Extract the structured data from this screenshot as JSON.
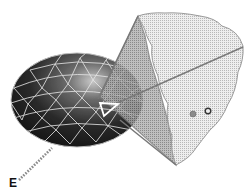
{
  "diagram": {
    "labels": {
      "eye_point": "E"
    },
    "colors": {
      "sphere_dark": "#1e1e1e",
      "sphere_mid": "#6a6a6a",
      "mesh_lines": "#e8e8e8",
      "patch_fill": "#d8d8d8",
      "plane_fill": "#8c8c8c",
      "edge": "#7a7a7a",
      "highlight_triangle": "#ffffff",
      "dot_gray": "#8a8a8a",
      "dot_ring": "#333333"
    },
    "elements": [
      "triangulated-ellipsoid",
      "highlighted-triangle",
      "projection-plane",
      "surface-patch",
      "projection-ray",
      "sample-point-gray",
      "sample-point-ring",
      "dotted-view-ray",
      "eye-point-label"
    ]
  }
}
